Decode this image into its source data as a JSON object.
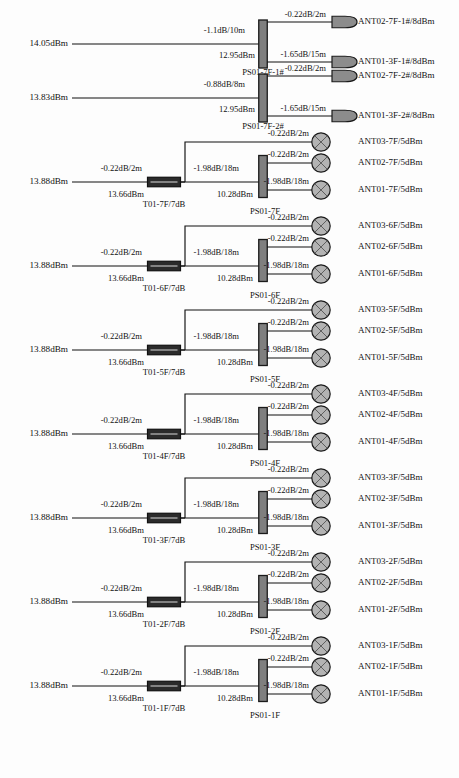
{
  "diagram": {
    "colors": {
      "line": "#111111",
      "splitter_fill": "#7f7f7f",
      "splitter_stroke": "#1a1a1a",
      "tap_fill": "#2b2b2b",
      "tap_stroke": "#111111",
      "antenna_circle_fill": "#b3b3b3",
      "antenna_bullet_fill": "#8c8c8c",
      "text": "#111111",
      "background": "#fdfdfd"
    },
    "sections": [
      {
        "id": "ps01-7f-1",
        "kind": "splitter-only",
        "input_power": "14.05dBm",
        "feeder_loss": "-1.1dB/10m",
        "node_power": "12.95dBm",
        "node_label": "PS01-7F-1#",
        "outputs": [
          {
            "loss": "-0.22dB/2m",
            "antenna": "ANT02-7F-1#/8dBm",
            "symbol": "bullet"
          },
          {
            "loss": "-1.65dB/15m",
            "antenna": "ANT01-3F-1#/8dBm",
            "symbol": "bullet"
          }
        ]
      },
      {
        "id": "ps01-7f-2",
        "kind": "splitter-only",
        "input_power": "13.83dBm",
        "feeder_loss": "-0.88dB/8m",
        "node_power": "12.95dBm",
        "node_label": "PS01-7F-2#",
        "outputs": [
          {
            "loss": "-0.22dB/2m",
            "antenna": "ANT02-7F-2#/8dBm",
            "symbol": "bullet"
          },
          {
            "loss": "-1.65dB/15m",
            "antenna": "ANT01-3F-2#/8dBm",
            "symbol": "bullet"
          }
        ]
      },
      {
        "id": "floor-7f",
        "kind": "tap-splitter",
        "input_power": "13.88dBm",
        "feeder_loss": "-0.22dB/2m",
        "tap_power": "13.66dBm",
        "tap_label": "T01-7F/7dB",
        "tap_branch_loss": "-0.22dB/2m",
        "tap_branch_antenna": "ANT03-7F/5dBm",
        "mid_loss": "-1.98dB/18m",
        "node_power": "10.28dBm",
        "node_label": "PS01-7F",
        "outputs": [
          {
            "loss": "-0.22dB/2m",
            "antenna": "ANT02-7F/5dBm",
            "symbol": "circle"
          },
          {
            "loss": "-1.98dB/18m",
            "antenna": "ANT01-7F/5dBm",
            "symbol": "circle"
          }
        ]
      },
      {
        "id": "floor-6f",
        "kind": "tap-splitter",
        "input_power": "13.88dBm",
        "feeder_loss": "-0.22dB/2m",
        "tap_power": "13.66dBm",
        "tap_label": "T01-6F/7dB",
        "tap_branch_loss": "-0.22dB/2m",
        "tap_branch_antenna": "ANT03-6F/5dBm",
        "mid_loss": "-1.98dB/18m",
        "node_power": "10.28dBm",
        "node_label": "PS01-6F",
        "outputs": [
          {
            "loss": "-0.22dB/2m",
            "antenna": "ANT02-6F/5dBm",
            "symbol": "circle"
          },
          {
            "loss": "-1.98dB/18m",
            "antenna": "ANT01-6F/5dBm",
            "symbol": "circle"
          }
        ]
      },
      {
        "id": "floor-5f",
        "kind": "tap-splitter",
        "input_power": "13.88dBm",
        "feeder_loss": "-0.22dB/2m",
        "tap_power": "13.66dBm",
        "tap_label": "T01-5F/7dB",
        "tap_branch_loss": "-0.22dB/2m",
        "tap_branch_antenna": "ANT03-5F/5dBm",
        "mid_loss": "-1.98dB/18m",
        "node_power": "10.28dBm",
        "node_label": "PS01-5F",
        "outputs": [
          {
            "loss": "-0.22dB/2m",
            "antenna": "ANT02-5F/5dBm",
            "symbol": "circle"
          },
          {
            "loss": "-1.98dB/18m",
            "antenna": "ANT01-5F/5dBm",
            "symbol": "circle"
          }
        ]
      },
      {
        "id": "floor-4f",
        "kind": "tap-splitter",
        "input_power": "13.88dBm",
        "feeder_loss": "-0.22dB/2m",
        "tap_power": "13.66dBm",
        "tap_label": "T01-4F/7dB",
        "tap_branch_loss": "-0.22dB/2m",
        "tap_branch_antenna": "ANT03-4F/5dBm",
        "mid_loss": "-1.98dB/18m",
        "node_power": "10.28dBm",
        "node_label": "PS01-4F",
        "outputs": [
          {
            "loss": "-0.22dB/2m",
            "antenna": "ANT02-4F/5dBm",
            "symbol": "circle"
          },
          {
            "loss": "-1.98dB/18m",
            "antenna": "ANT01-4F/5dBm",
            "symbol": "circle"
          }
        ]
      },
      {
        "id": "floor-3f",
        "kind": "tap-splitter",
        "input_power": "13.88dBm",
        "feeder_loss": "-0.22dB/2m",
        "tap_power": "13.66dBm",
        "tap_label": "T01-3F/7dB",
        "tap_branch_loss": "-0.22dB/2m",
        "tap_branch_antenna": "ANT03-3F/5dBm",
        "mid_loss": "-1.98dB/18m",
        "node_power": "10.28dBm",
        "node_label": "PS01-3F",
        "outputs": [
          {
            "loss": "-0.22dB/2m",
            "antenna": "ANT02-3F/5dBm",
            "symbol": "circle"
          },
          {
            "loss": "-1.98dB/18m",
            "antenna": "ANT01-3F/5dBm",
            "symbol": "circle"
          }
        ]
      },
      {
        "id": "floor-2f",
        "kind": "tap-splitter",
        "input_power": "13.88dBm",
        "feeder_loss": "-0.22dB/2m",
        "tap_power": "13.66dBm",
        "tap_label": "T01-2F/7dB",
        "tap_branch_loss": "-0.22dB/2m",
        "tap_branch_antenna": "ANT03-2F/5dBm",
        "mid_loss": "-1.98dB/18m",
        "node_power": "10.28dBm",
        "node_label": "PS01-2F",
        "outputs": [
          {
            "loss": "-0.22dB/2m",
            "antenna": "ANT02-2F/5dBm",
            "symbol": "circle"
          },
          {
            "loss": "-1.98dB/18m",
            "antenna": "ANT01-2F/5dBm",
            "symbol": "circle"
          }
        ]
      },
      {
        "id": "floor-1f",
        "kind": "tap-splitter",
        "input_power": "13.88dBm",
        "feeder_loss": "-0.22dB/2m",
        "tap_power": "13.66dBm",
        "tap_label": "T01-1F/7dB",
        "tap_branch_loss": "-0.22dB/2m",
        "tap_branch_antenna": "ANT03-1F/5dBm",
        "mid_loss": "-1.98dB/18m",
        "node_power": "10.28dBm",
        "node_label": "PS01-1F",
        "outputs": [
          {
            "loss": "-0.22dB/2m",
            "antenna": "ANT02-1F/5dBm",
            "symbol": "circle"
          },
          {
            "loss": "-1.98dB/18m",
            "antenna": "ANT01-1F/5dBm",
            "symbol": "circle"
          }
        ]
      }
    ]
  }
}
